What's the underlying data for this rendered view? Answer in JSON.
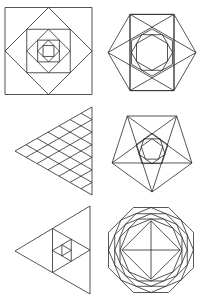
{
  "figure": {
    "background": "#ffffff",
    "stroke_color": "#2a2a2a",
    "stroke_width": 0.8,
    "panels": [
      {
        "id": "nested-squares",
        "shape": "square",
        "cx": 48.5,
        "cy": 51,
        "outer_half": 43.5,
        "levels": 7,
        "rotate_each": 45,
        "scale_each": 0.7071
      },
      {
        "id": "hexagon-star",
        "shape": "hexagon",
        "cx": 152,
        "cy": 52.5,
        "r": 44,
        "inner_levels": 3,
        "inner_r": 17.5
      },
      {
        "id": "triangle-lattice",
        "shape": "triangle-lattice",
        "apex": [
          15,
          151
        ],
        "top": [
          92,
          107
        ],
        "bottom": [
          92,
          195
        ],
        "divisions": 7
      },
      {
        "id": "pentagon-star",
        "shape": "pentagon",
        "cx": 152,
        "cy": 150,
        "r": 42,
        "start_angle": -54,
        "inner_levels": 3,
        "inner_r": 12
      },
      {
        "id": "nested-triangles",
        "shape": "triangle",
        "apex": [
          15,
          251
        ],
        "top": [
          90,
          206
        ],
        "bottom": [
          90,
          294
        ],
        "levels": 4
      },
      {
        "id": "octagon-rosette",
        "shape": "octagon",
        "cx": 151,
        "cy": 250,
        "r": 46,
        "levels": 6,
        "rotate_each": 22.5,
        "scale_each": 0.9239
      }
    ]
  }
}
